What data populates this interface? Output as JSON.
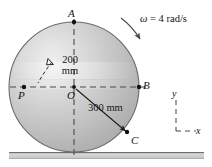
{
  "figure": {
    "type": "engineering-diagram",
    "points": [
      {
        "id": "A",
        "label": "A",
        "x": 74,
        "y": 22,
        "label_x": 68,
        "label_y": 8
      },
      {
        "id": "B",
        "label": "B",
        "x": 139,
        "y": 87,
        "label_x": 143,
        "label_y": 80
      },
      {
        "id": "O",
        "label": "O",
        "x": 74,
        "y": 87,
        "label_x": 67,
        "label_y": 90
      },
      {
        "id": "P",
        "label": "P",
        "x": 24,
        "y": 87,
        "label_x": 18,
        "label_y": 90
      },
      {
        "id": "C",
        "label": "C",
        "x": 127,
        "y": 133,
        "label_x": 131,
        "label_y": 135
      }
    ],
    "dimensions": {
      "radial_inner": {
        "value": "200",
        "unit": "mm",
        "text_line1": "200",
        "text_line2": "mm"
      },
      "radial_outer": {
        "value": "300",
        "unit": "mm",
        "text": "300 mm"
      }
    },
    "angular_velocity": {
      "symbol": "ω",
      "equals": " = 4 rad/s",
      "full_text": "ω = 4 rad/s",
      "magnitude": "4",
      "units": "rad/s",
      "sense": "clockwise"
    },
    "axes_legend": {
      "y_label": "y",
      "x_label": "x"
    },
    "ground": {
      "present": true
    },
    "colors": {
      "disk_light": "#f0f0f0",
      "disk_mid": "#c8c8c8",
      "disk_dark": "#9a9a9a",
      "outline": "#5a5a5a",
      "dashed": "#4a4a4a",
      "ground_fill": "#cfcfcf",
      "ground_edge": "#6e6e6e",
      "text": "#141414"
    }
  }
}
